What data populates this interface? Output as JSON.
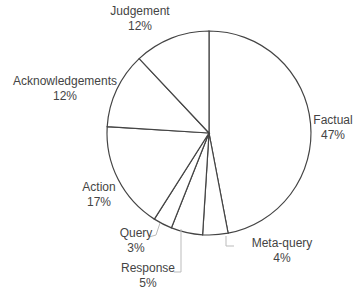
{
  "chart_data": {
    "type": "pie",
    "title": "",
    "start_angle_deg": 0,
    "direction": "clockwise",
    "slices": [
      {
        "label": "Factual",
        "value": 47,
        "pct_label": "47%"
      },
      {
        "label": "Meta-query",
        "value": 4,
        "pct_label": "4%"
      },
      {
        "label": "Response",
        "value": 5,
        "pct_label": "5%"
      },
      {
        "label": "Query",
        "value": 3,
        "pct_label": "3%"
      },
      {
        "label": "Action",
        "value": 17,
        "pct_label": "17%"
      },
      {
        "label": "Acknowledgements",
        "value": 12,
        "pct_label": "12%"
      },
      {
        "label": "Judgement",
        "value": 12,
        "pct_label": "12%"
      }
    ],
    "fill": "#ffffff",
    "stroke": "#444444",
    "leader_color": "#bbbbbb",
    "legend": "none (data labels outside slices)"
  },
  "labels": [
    {
      "name": "Factual",
      "pct": "47%",
      "x": 333,
      "y": 113
    },
    {
      "name": "Meta-query",
      "pct": "4%",
      "x": 282,
      "y": 236
    },
    {
      "name": "Response",
      "pct": "5%",
      "x": 148,
      "y": 261
    },
    {
      "name": "Query",
      "pct": "3%",
      "x": 136,
      "y": 226
    },
    {
      "name": "Action",
      "pct": "17%",
      "x": 99,
      "y": 180
    },
    {
      "name": "Acknowledgements",
      "pct": "12%",
      "x": 65,
      "y": 74
    },
    {
      "name": "Judgement",
      "pct": "12%",
      "x": 140,
      "y": 4
    }
  ]
}
